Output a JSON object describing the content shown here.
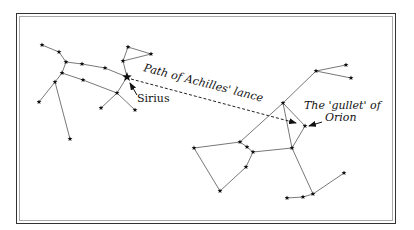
{
  "diagram": {
    "type": "star-chart",
    "labels": {
      "sirius": "Sirius",
      "path": "Path of Achilles' lance",
      "gullet_line1": "The 'gullet' of",
      "gullet_line2": "Orion"
    },
    "colors": {
      "stroke": "#555555",
      "star": "#111111",
      "border_outer": "#333333",
      "border_inner": "#aaaaaa"
    },
    "constellations": [
      {
        "name": "canis-major",
        "stars": [
          {
            "id": "A",
            "x": 42,
            "y": 45
          },
          {
            "id": "B",
            "x": 59,
            "y": 52
          },
          {
            "id": "C",
            "x": 66,
            "y": 62
          },
          {
            "id": "D",
            "x": 82,
            "y": 64
          },
          {
            "id": "E",
            "x": 105,
            "y": 68
          },
          {
            "id": "sirius",
            "x": 127,
            "y": 77,
            "size": "large"
          },
          {
            "id": "F",
            "x": 62,
            "y": 73
          },
          {
            "id": "G",
            "x": 55,
            "y": 82
          },
          {
            "id": "H",
            "x": 83,
            "y": 80
          },
          {
            "id": "I",
            "x": 117,
            "y": 93
          },
          {
            "id": "J",
            "x": 39,
            "y": 102
          },
          {
            "id": "K",
            "x": 101,
            "y": 108
          },
          {
            "id": "L",
            "x": 135,
            "y": 110
          },
          {
            "id": "Z",
            "x": 70,
            "y": 139
          },
          {
            "id": "T1",
            "x": 128,
            "y": 47
          },
          {
            "id": "T2",
            "x": 151,
            "y": 54
          },
          {
            "id": "T3",
            "x": 123,
            "y": 61
          }
        ],
        "edges": [
          [
            "A",
            "B"
          ],
          [
            "B",
            "C"
          ],
          [
            "C",
            "D"
          ],
          [
            "D",
            "E"
          ],
          [
            "E",
            "sirius"
          ],
          [
            "C",
            "F"
          ],
          [
            "F",
            "H"
          ],
          [
            "H",
            "I"
          ],
          [
            "F",
            "G"
          ],
          [
            "G",
            "J"
          ],
          [
            "G",
            "Z"
          ],
          [
            "sirius",
            "I"
          ],
          [
            "I",
            "K"
          ],
          [
            "I",
            "L"
          ],
          [
            "sirius",
            "T3"
          ],
          [
            "T3",
            "T1"
          ],
          [
            "T1",
            "T2"
          ],
          [
            "T2",
            "T3"
          ]
        ]
      },
      {
        "name": "orion",
        "stars": [
          {
            "id": "O1",
            "x": 316,
            "y": 71
          },
          {
            "id": "O2",
            "x": 346,
            "y": 65
          },
          {
            "id": "O3",
            "x": 351,
            "y": 78
          },
          {
            "id": "M",
            "x": 283,
            "y": 103
          },
          {
            "id": "gullet",
            "x": 305,
            "y": 126
          },
          {
            "id": "N",
            "x": 194,
            "y": 148
          },
          {
            "id": "O",
            "x": 240,
            "y": 142
          },
          {
            "id": "P",
            "x": 247,
            "y": 147
          },
          {
            "id": "Q",
            "x": 253,
            "y": 152
          },
          {
            "id": "R",
            "x": 246,
            "y": 167
          },
          {
            "id": "S",
            "x": 220,
            "y": 191
          },
          {
            "id": "T",
            "x": 292,
            "y": 148
          },
          {
            "id": "U",
            "x": 287,
            "y": 198
          },
          {
            "id": "V",
            "x": 303,
            "y": 197
          },
          {
            "id": "W",
            "x": 313,
            "y": 194
          },
          {
            "id": "X",
            "x": 344,
            "y": 173
          }
        ],
        "edges": [
          [
            "O2",
            "O1"
          ],
          [
            "O1",
            "O3"
          ],
          [
            "O1",
            "M"
          ],
          [
            "M",
            "O"
          ],
          [
            "M",
            "T"
          ],
          [
            "M",
            "gullet"
          ],
          [
            "gullet",
            "T"
          ],
          [
            "O",
            "P"
          ],
          [
            "P",
            "Q"
          ],
          [
            "Q",
            "T"
          ],
          [
            "O",
            "N"
          ],
          [
            "N",
            "S"
          ],
          [
            "S",
            "R"
          ],
          [
            "R",
            "Q"
          ],
          [
            "T",
            "W"
          ],
          [
            "W",
            "V"
          ],
          [
            "V",
            "U"
          ],
          [
            "W",
            "X"
          ]
        ]
      }
    ]
  }
}
